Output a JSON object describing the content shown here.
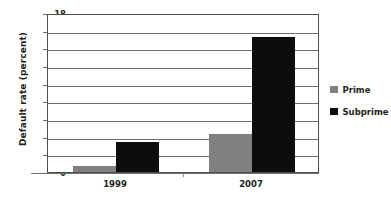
{
  "chart_data": {
    "type": "bar",
    "title": "",
    "xlabel": "",
    "ylabel": "Default rate (percent)",
    "categories": [
      "1999",
      "2007"
    ],
    "series": [
      {
        "name": "Prime",
        "color": "#808080",
        "values": [
          0.7,
          4.3
        ]
      },
      {
        "name": "Subprime",
        "color": "#0d0d0d",
        "values": [
          3.4,
          15.3
        ]
      }
    ],
    "ylim": [
      0,
      18
    ],
    "ytick_step": 2,
    "yticks": [
      0,
      2,
      4,
      6,
      8,
      10,
      12,
      14,
      16,
      18
    ],
    "ytick_labels": [
      "0",
      "2",
      "4",
      "6",
      "8",
      "10",
      "12",
      "14",
      "16",
      "18"
    ],
    "grid": true,
    "grid_axis": "y",
    "legend_position": "right"
  },
  "legend": {
    "entries": [
      {
        "label": "Prime",
        "color": "#808080"
      },
      {
        "label": "Subprime",
        "color": "#0d0d0d"
      }
    ]
  },
  "axes": {
    "y_title": "Default rate (percent)",
    "x_labels": [
      "1999",
      "2007"
    ]
  }
}
